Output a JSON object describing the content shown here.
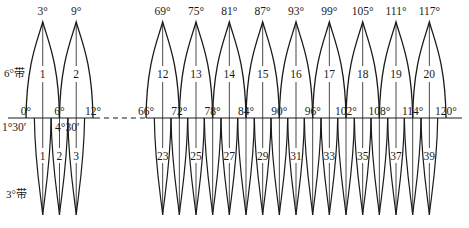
{
  "diagram": {
    "colors": {
      "stroke": "#1a1a1a",
      "background": "#ffffff"
    },
    "layout": {
      "axis_y": 118,
      "apex_y": 22,
      "tip_y": 215,
      "left_segment": {
        "deg0": 0,
        "x0": 26,
        "px_per_deg": 5.58
      },
      "right_segment": {
        "deg0": 66,
        "x0": 146,
        "px_per_deg": 5.556
      },
      "axis_x_start": 8,
      "axis_x_end": 462,
      "dash_from_deg": 12,
      "dash_to_deg": 66
    },
    "band_labels": {
      "six_degree": "6°带",
      "three_degree": "3°带"
    },
    "six_degree_zones": [
      {
        "number": "1",
        "west": 0,
        "central": 3,
        "east": 6,
        "central_label": "3°"
      },
      {
        "number": "2",
        "west": 6,
        "central": 9,
        "east": 12,
        "central_label": "9°"
      },
      {
        "number": "12",
        "west": 66,
        "central": 69,
        "east": 72,
        "central_label": "69°"
      },
      {
        "number": "13",
        "west": 72,
        "central": 75,
        "east": 78,
        "central_label": "75°"
      },
      {
        "number": "14",
        "west": 78,
        "central": 81,
        "east": 84,
        "central_label": "81°"
      },
      {
        "number": "15",
        "west": 84,
        "central": 87,
        "east": 90,
        "central_label": "87°"
      },
      {
        "number": "16",
        "west": 90,
        "central": 93,
        "east": 96,
        "central_label": "93°"
      },
      {
        "number": "17",
        "west": 96,
        "central": 99,
        "east": 102,
        "central_label": "99°"
      },
      {
        "number": "18",
        "west": 102,
        "central": 105,
        "east": 108,
        "central_label": "105°"
      },
      {
        "number": "19",
        "west": 108,
        "central": 111,
        "east": 114,
        "central_label": "111°"
      },
      {
        "number": "20",
        "west": 114,
        "central": 117,
        "east": 120,
        "central_label": "117°"
      }
    ],
    "boundary_labels": [
      {
        "deg": 0,
        "text": "0°"
      },
      {
        "deg": 6,
        "text": "6°"
      },
      {
        "deg": 12,
        "text": "12°"
      },
      {
        "deg": 66,
        "text": "66°"
      },
      {
        "deg": 72,
        "text": "72°"
      },
      {
        "deg": 78,
        "text": "78°"
      },
      {
        "deg": 84,
        "text": "84°"
      },
      {
        "deg": 90,
        "text": "90°"
      },
      {
        "deg": 96,
        "text": "96°"
      },
      {
        "deg": 102,
        "text": "102°"
      },
      {
        "deg": 108,
        "text": "108°"
      },
      {
        "deg": 114,
        "text": "114°"
      },
      {
        "deg": 120,
        "text": "120°"
      }
    ],
    "three_degree_boundary_labels": [
      {
        "deg": 1.5,
        "text": "1°30′"
      },
      {
        "deg": 4.5,
        "text": "4°30′"
      }
    ],
    "three_degree_zones_left": [
      {
        "number": "1",
        "central": 3
      },
      {
        "number": "2",
        "central": 6
      },
      {
        "number": "3",
        "central": 9
      }
    ],
    "three_degree_zones_right": [
      {
        "number": "23",
        "central": 69,
        "labeled": true
      },
      {
        "number": "24",
        "central": 72,
        "labeled": false
      },
      {
        "number": "25",
        "central": 75,
        "labeled": true
      },
      {
        "number": "26",
        "central": 78,
        "labeled": false
      },
      {
        "number": "27",
        "central": 81,
        "labeled": true
      },
      {
        "number": "28",
        "central": 84,
        "labeled": false
      },
      {
        "number": "29",
        "central": 87,
        "labeled": true
      },
      {
        "number": "30",
        "central": 90,
        "labeled": false
      },
      {
        "number": "31",
        "central": 93,
        "labeled": true
      },
      {
        "number": "32",
        "central": 96,
        "labeled": false
      },
      {
        "number": "33",
        "central": 99,
        "labeled": true
      },
      {
        "number": "34",
        "central": 102,
        "labeled": false
      },
      {
        "number": "35",
        "central": 105,
        "labeled": true
      },
      {
        "number": "36",
        "central": 108,
        "labeled": false
      },
      {
        "number": "37",
        "central": 111,
        "labeled": true
      },
      {
        "number": "38",
        "central": 114,
        "labeled": false
      },
      {
        "number": "39",
        "central": 117,
        "labeled": true
      }
    ]
  }
}
